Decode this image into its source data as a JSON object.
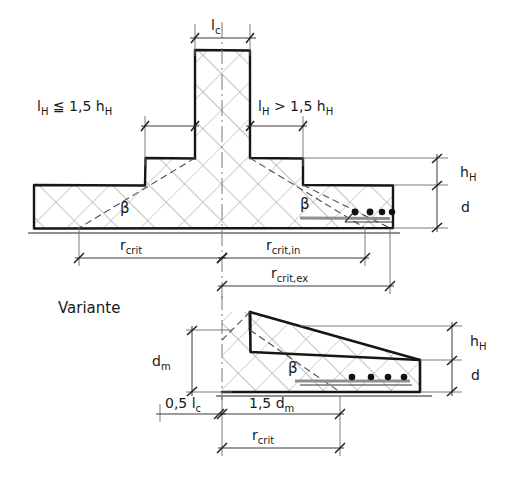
{
  "figure": {
    "type": "engineering-section-drawing",
    "title_text": "Variante"
  },
  "labels": {
    "lc": "l",
    "lc_sub": "c",
    "lh_left_main": "l",
    "lh_left_sub": "H",
    "lh_left_rel": "≦ 1,5 h",
    "lh_left_rel_sub": "H",
    "lh_right_main": "l",
    "lh_right_sub": "H",
    "lh_right_rel": "> 1,5 h",
    "lh_right_rel_sub": "H",
    "hH": "h",
    "hH_sub": "H",
    "d": "d",
    "beta": "β",
    "r_crit": "r",
    "r_crit_sub": "crit",
    "r_crit_in": "r",
    "r_crit_in_sub": "crit,in",
    "r_crit_ex": "r",
    "r_crit_ex_sub": "crit,ex",
    "variante": "Variante",
    "dm": "d",
    "dm_sub": "m",
    "half_lc": "0,5 l",
    "half_lc_sub": "c",
    "one_five_dm": "1,5 d",
    "one_five_dm_sub": "m"
  },
  "colors": {
    "ink": "#1a1a1a",
    "hatch": "#8a8a8a",
    "thin": "#555555",
    "paper": "#ffffff",
    "rebar": "#111111"
  },
  "geometry": {
    "top_section": {
      "column_left_x": 195,
      "column_right_x": 250,
      "column_top_y": 50,
      "head_left_x": 145,
      "head_right_x": 303,
      "head_top_y": 158,
      "slab_left_x": 34,
      "slab_right_x": 393,
      "slab_top_y": 185,
      "slab_bottom_y": 228,
      "ground_y": 233,
      "rebar_count": 4
    },
    "lower_section": {
      "axis_x": 222,
      "wall_x": 250,
      "wall_top_y": 312,
      "slope_end_x": 420,
      "slope_end_y": 360,
      "base_y": 392,
      "ground_y": 396,
      "rebar_count": 4
    }
  },
  "dimension_chains": {
    "top": [
      {
        "name": "lc",
        "from_x": 195,
        "to_x": 250,
        "y": 34
      },
      {
        "name": "lh_left",
        "from_x": 145,
        "to_x": 195,
        "y": 122
      },
      {
        "name": "lh_right",
        "from_x": 250,
        "to_x": 303,
        "y": 122
      },
      {
        "name": "hH",
        "from_y": 158,
        "to_y": 185,
        "x": 437
      },
      {
        "name": "d",
        "from_y": 185,
        "to_y": 228,
        "x": 437
      },
      {
        "name": "r_crit",
        "from_x": 79,
        "to_x": 222,
        "y": 258
      },
      {
        "name": "r_crit_in",
        "from_x": 222,
        "to_x": 365,
        "y": 258
      },
      {
        "name": "r_crit_ex",
        "from_x": 222,
        "to_x": 390,
        "y": 286
      }
    ],
    "lower": [
      {
        "name": "dm",
        "from_y": 330,
        "to_y": 392,
        "x": 192
      },
      {
        "name": "hH",
        "from_y": 318,
        "to_y": 352,
        "x": 452
      },
      {
        "name": "d",
        "from_y": 352,
        "to_y": 392,
        "x": 452
      },
      {
        "name": "half_lc",
        "from_x": 160,
        "to_x": 222,
        "y": 414
      },
      {
        "name": "one_five_dm",
        "from_x": 222,
        "to_x": 340,
        "y": 414
      },
      {
        "name": "r_crit",
        "from_x": 222,
        "to_x": 340,
        "y": 448
      }
    ]
  }
}
